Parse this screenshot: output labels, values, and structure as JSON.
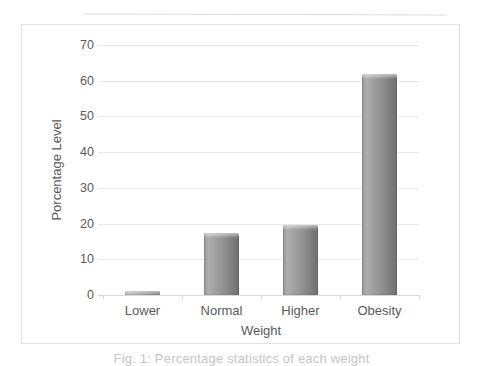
{
  "chart_data": {
    "type": "bar",
    "title": "",
    "categories": [
      "Lower",
      "Normal",
      "Higher",
      "Obesity"
    ],
    "values": [
      1,
      17.5,
      19.5,
      62
    ],
    "xlabel": "Weight",
    "ylabel": "Porcentage Level",
    "ylim": [
      0,
      70
    ],
    "yticks": [
      0,
      10,
      20,
      30,
      40,
      50,
      60,
      70
    ],
    "grid": true,
    "legend": false,
    "colors": {
      "bar_light": "#aeaeae",
      "bar_mid": "#939393",
      "bar_dark": "#6e6e6e",
      "gridline": "#e9e9e9",
      "baseline": "#d8d8d8",
      "axis_text": "#5a5a5a",
      "frame_border": "#e3e3e3",
      "background": "#ffffff"
    }
  },
  "caption": {
    "text": "Fig. 1: Percentage statistics of each weight",
    "color": "#c6c6c6"
  },
  "decor": {
    "top_rule_color": "#dcdcdc"
  }
}
